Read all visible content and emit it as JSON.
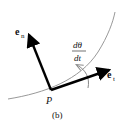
{
  "diagram": {
    "caption": "(b)",
    "point_label": "P",
    "normal_vector": {
      "base": "e",
      "subscript": "n"
    },
    "tangent_vector": {
      "base": "e",
      "subscript": "t"
    },
    "rate_label": {
      "numerator": "dθ",
      "denominator": "dt"
    },
    "colors": {
      "arrow": "#000000",
      "curve": "#999999",
      "text": "#111111"
    }
  }
}
